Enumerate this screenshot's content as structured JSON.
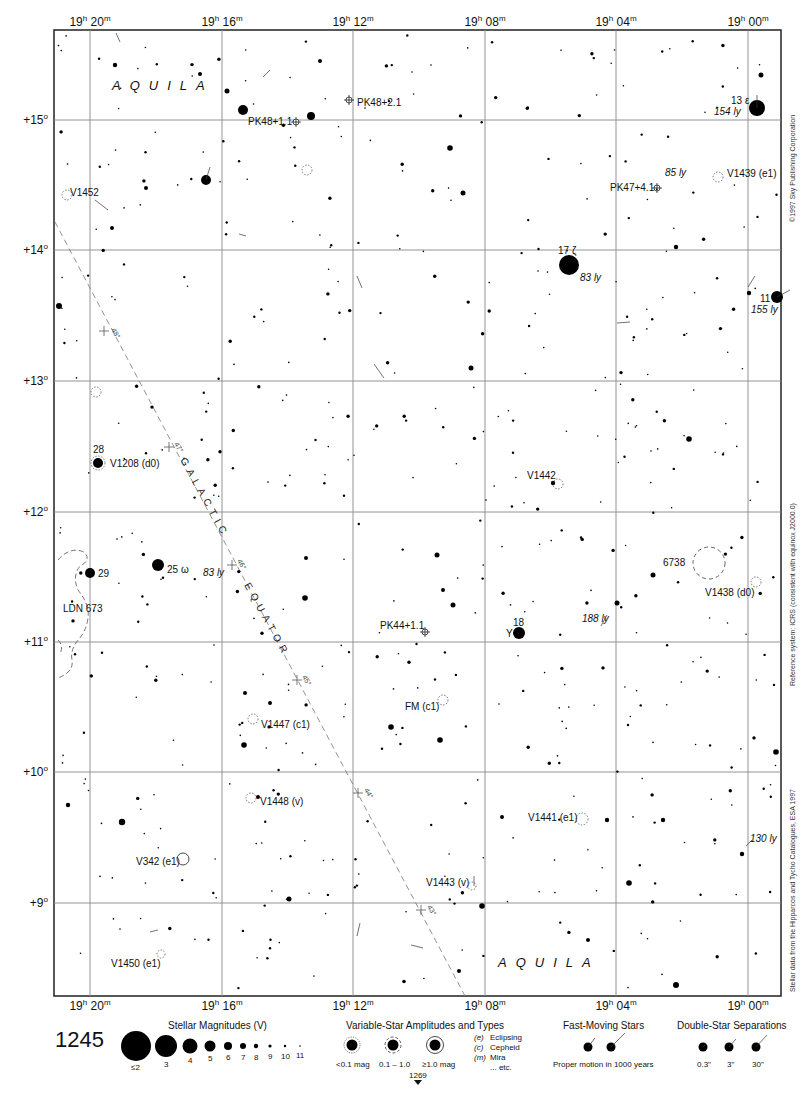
{
  "chart": {
    "page_number": "1245",
    "next_page": "1269",
    "constellation_labels": [
      {
        "text": "AQUILA",
        "x": 112,
        "y": 78
      },
      {
        "text": "AQUILA",
        "x": 498,
        "y": 955
      }
    ],
    "ra_ticks_top": [
      {
        "h": "19",
        "m": "20",
        "x": 90
      },
      {
        "h": "19",
        "m": "16",
        "x": 222
      },
      {
        "h": "19",
        "m": "12",
        "x": 353
      },
      {
        "h": "19",
        "m": "08",
        "x": 485
      },
      {
        "h": "19",
        "m": "04",
        "x": 616
      },
      {
        "h": "19",
        "m": "00",
        "x": 748
      }
    ],
    "dec_ticks": [
      {
        "label": "+15",
        "y": 120
      },
      {
        "label": "+14",
        "y": 250
      },
      {
        "label": "+13",
        "y": 381
      },
      {
        "label": "+12",
        "y": 512
      },
      {
        "label": "+11",
        "y": 642
      },
      {
        "label": "+10",
        "y": 772
      },
      {
        "label": "+9",
        "y": 903
      }
    ],
    "galactic_equator": {
      "label_words": [
        "GALACTIC",
        "EQUATOR"
      ],
      "ticks": [
        "48°",
        "47°",
        "46°",
        "45°",
        "44°",
        "43°"
      ]
    },
    "object_labels": [
      {
        "text": "PK48+2.1",
        "x": 357,
        "y": 97
      },
      {
        "text": "PK48+1.1",
        "x": 248,
        "y": 116
      },
      {
        "text": "13 ε",
        "x": 731,
        "y": 95
      },
      {
        "text": "154 ly",
        "x": 714,
        "y": 106,
        "italic": true
      },
      {
        "text": "V1452",
        "x": 70,
        "y": 187
      },
      {
        "text": "85 ly",
        "x": 665,
        "y": 167,
        "italic": true
      },
      {
        "text": "PK47+4.1",
        "x": 610,
        "y": 182
      },
      {
        "text": "V1439 (e1)",
        "x": 727,
        "y": 168
      },
      {
        "text": "17 ζ",
        "x": 558,
        "y": 245
      },
      {
        "text": "83 ly",
        "x": 580,
        "y": 272,
        "italic": true
      },
      {
        "text": "11",
        "x": 760,
        "y": 293
      },
      {
        "text": "155 ly",
        "x": 751,
        "y": 304,
        "italic": true
      },
      {
        "text": "28",
        "x": 93,
        "y": 444
      },
      {
        "text": "V1208 (d0)",
        "x": 110,
        "y": 458
      },
      {
        "text": "V1442",
        "x": 527,
        "y": 470
      },
      {
        "text": "25 ω",
        "x": 167,
        "y": 564
      },
      {
        "text": "29",
        "x": 98,
        "y": 568
      },
      {
        "text": "83 ly",
        "x": 203,
        "y": 567,
        "italic": true
      },
      {
        "text": "6738",
        "x": 663,
        "y": 557
      },
      {
        "text": "V1438 (d0)",
        "x": 705,
        "y": 587
      },
      {
        "text": "LDN 673",
        "x": 63,
        "y": 603
      },
      {
        "text": "PK44+1.1",
        "x": 380,
        "y": 620
      },
      {
        "text": "18",
        "x": 513,
        "y": 617
      },
      {
        "text": "Y",
        "x": 506,
        "y": 628
      },
      {
        "text": "188 ly",
        "x": 582,
        "y": 613,
        "italic": true
      },
      {
        "text": "FM (c1)",
        "x": 405,
        "y": 701
      },
      {
        "text": "V1447 (c1)",
        "x": 261,
        "y": 719
      },
      {
        "text": "V1448 (v)",
        "x": 260,
        "y": 796
      },
      {
        "text": "V1441 (e1)",
        "x": 528,
        "y": 812
      },
      {
        "text": "130 ly",
        "x": 750,
        "y": 833,
        "italic": true
      },
      {
        "text": "V342 (e1)",
        "x": 136,
        "y": 856
      },
      {
        "text": "V1443 (v)",
        "x": 426,
        "y": 877
      },
      {
        "text": "V1450 (e1)",
        "x": 111,
        "y": 958
      }
    ],
    "side_notes": {
      "copyright": "©1997 Sky Publishing Corporation",
      "reference": "Reference system: ICRS (consistent with equinox J2000.0)",
      "data_source": "Stellar data from the Hipparcos and Tycho Catalogues, ESA 1997"
    }
  },
  "legend": {
    "magnitudes": {
      "title": "Stellar Magnitudes (V)",
      "items": [
        "≤2",
        "3",
        "4",
        "5",
        "6",
        "7",
        "8",
        "9",
        "10",
        "11"
      ]
    },
    "variables": {
      "title": "Variable-Star Amplitudes and Types",
      "amplitudes": [
        "<0.1 mag",
        "0.1 – 1.0",
        "≥1.0 mag"
      ],
      "types": [
        {
          "code": "(e)",
          "name": "Eclipsing"
        },
        {
          "code": "(c)",
          "name": "Cepheid"
        },
        {
          "code": "(m)",
          "name": "Mira"
        },
        {
          "code": "",
          "name": "... etc."
        }
      ]
    },
    "fast_moving": {
      "title": "Fast-Moving Stars",
      "caption": "Proper motion in 1000 years"
    },
    "double_stars": {
      "title": "Double-Star Separations",
      "items": [
        "0.3\"",
        "3\"",
        "30\""
      ]
    }
  }
}
